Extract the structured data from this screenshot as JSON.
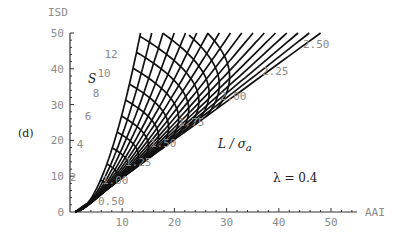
{
  "panel_label": "(d)",
  "annotation": "λ = 0.4",
  "family_labels": {
    "s_symbol": "S",
    "l_symbol": "L / σ",
    "l_subscript": "a"
  },
  "chart_data": {
    "type": "line",
    "title": "",
    "xlabel": "AAI",
    "ylabel": "ISD",
    "xlim": [
      0,
      55
    ],
    "ylim": [
      0,
      50
    ],
    "x_ticks": [
      10,
      20,
      30,
      40,
      50
    ],
    "y_ticks": [
      0,
      10,
      20,
      30,
      40,
      50
    ],
    "grid": false,
    "s_curves": {
      "name": "S",
      "labels": [
        "2",
        "4",
        "6",
        "8",
        "10",
        "12"
      ],
      "values": [
        2,
        4,
        6,
        8,
        10,
        12
      ]
    },
    "l_curves": {
      "name": "L / σa",
      "labels": [
        "0.50",
        "1.00",
        "1.25",
        "1.50",
        "1.75",
        "2.00",
        "2.25",
        "2.50"
      ],
      "values": [
        0.5,
        1.0,
        1.25,
        1.5,
        1.75,
        2.0,
        2.25,
        2.5
      ]
    },
    "annotation": "λ = 0.4",
    "origin_point": [
      1,
      0
    ],
    "left_boundary_top": [
      13.5,
      50
    ],
    "right_boundary_top": [
      48,
      50
    ]
  }
}
